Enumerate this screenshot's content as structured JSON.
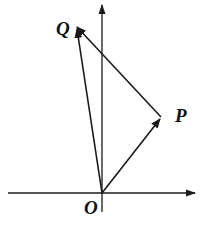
{
  "diagram": {
    "type": "vector-diagram",
    "axes": {
      "origin": {
        "x": 102,
        "y": 193
      },
      "x_axis": {
        "from": 8,
        "to": 195
      },
      "y_axis": {
        "from": 212,
        "to": 5
      }
    },
    "points": {
      "O": {
        "label": "O",
        "x": 102,
        "y": 193,
        "label_x": 86,
        "label_y": 213
      },
      "P": {
        "label": "P",
        "x": 161,
        "y": 117,
        "label_x": 175,
        "label_y": 122
      },
      "Q": {
        "label": "Q",
        "x": 76,
        "y": 27,
        "label_x": 56,
        "label_y": 35
      }
    },
    "vectors": [
      {
        "name": "OP",
        "from": "O",
        "to": "P"
      },
      {
        "name": "OQ",
        "from": "O",
        "to": "Q"
      },
      {
        "name": "PQ",
        "from": "P",
        "to": "Q"
      }
    ],
    "colors": {
      "stroke": "#1a1a1a",
      "background": "#ffffff"
    }
  }
}
